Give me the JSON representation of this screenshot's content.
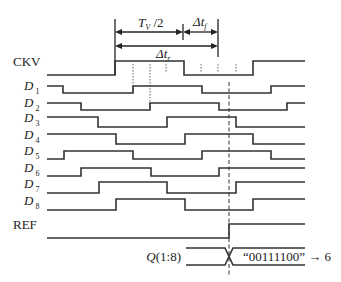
{
  "diagram": {
    "type": "timing-diagram",
    "dimensions": {
      "half_period": {
        "main": "T",
        "sub": "V",
        "suffix": " /2"
      },
      "fall_delay": {
        "main": "Δt",
        "sub": "f"
      },
      "rise_delay": {
        "main": "Δt",
        "sub": "r"
      }
    },
    "signals": [
      {
        "name": "CKV",
        "italic": false,
        "sub": "",
        "y_high": 61,
        "y_low": 75,
        "start": "low",
        "edges": [
          115,
          184,
          253
        ]
      },
      {
        "name": "D",
        "italic": true,
        "sub": "1",
        "y_high": 86,
        "y_low": 93,
        "start": "high",
        "edges": [
          63,
          133,
          202,
          271
        ]
      },
      {
        "name": "D",
        "italic": true,
        "sub": "2",
        "y_high": 103,
        "y_low": 110,
        "start": "high",
        "edges": [
          81,
          150,
          219,
          287
        ]
      },
      {
        "name": "D",
        "italic": true,
        "sub": "3",
        "y_high": 117,
        "y_low": 127,
        "start": "high",
        "edges": [
          98,
          167,
          236
        ]
      },
      {
        "name": "D",
        "italic": true,
        "sub": "4",
        "y_high": 134,
        "y_low": 144,
        "start": "high",
        "edges": [
          116,
          185,
          253
        ]
      },
      {
        "name": "D",
        "italic": true,
        "sub": "5",
        "y_high": 151,
        "y_low": 159,
        "start": "low",
        "edges": [
          64,
          133,
          202,
          271
        ]
      },
      {
        "name": "D",
        "italic": true,
        "sub": "6",
        "y_high": 168,
        "y_low": 176,
        "start": "low",
        "edges": [
          81,
          151,
          219
        ]
      },
      {
        "name": "D",
        "italic": true,
        "sub": "7",
        "y_high": 182,
        "y_low": 193,
        "start": "low",
        "edges": [
          99,
          167,
          236
        ]
      },
      {
        "name": "D",
        "italic": true,
        "sub": "8",
        "y_high": 199,
        "y_low": 210,
        "start": "low",
        "edges": [
          116,
          185,
          253
        ]
      },
      {
        "name": "REF",
        "italic": false,
        "sub": "",
        "y_high": 224,
        "y_low": 238,
        "start": "low",
        "edges": [
          229
        ]
      }
    ],
    "bus": {
      "label": "Q(1:8)",
      "value": "“00111100” → 6",
      "x_start": 186,
      "x_cross": 229,
      "x_end": 305,
      "y_top": 248,
      "y_bot": 265
    },
    "x_start": 47,
    "x_end": 305,
    "ref_line_x": 229
  }
}
